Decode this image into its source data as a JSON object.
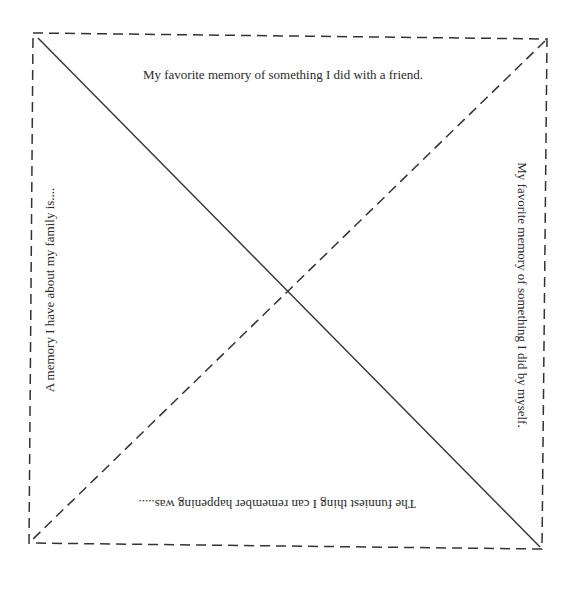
{
  "document": {
    "type": "paper fortune-teller / fold template",
    "prompts": {
      "top": "My favorite memory of something I did with a friend.",
      "right": "My favorite memory of  something I did by myself.",
      "bottom": "The funniest thing I can remember happening was.....",
      "left": "A memory I have about my family is...."
    },
    "line_style": {
      "border": "dashed",
      "diagonal_tl_br": "solid",
      "diagonal_tr_bl": "dashed",
      "color": "#333333"
    }
  }
}
